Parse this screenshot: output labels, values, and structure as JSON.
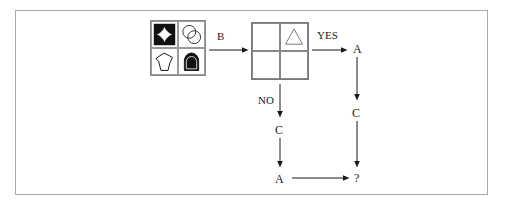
{
  "diagram": {
    "type": "flowchart-visual-reasoning-puzzle",
    "background_color": "#ffffff",
    "frame_border_color": "#a9a9a9",
    "ink_color": "#1a1a1a"
  },
  "source_grid": {
    "name": "source-shape-grid",
    "rows": 2,
    "columns": 2,
    "cells": [
      {
        "position": "top-left",
        "shape": "concave-diamond-astroid",
        "fill": "black-square-background",
        "shape_fill": "white",
        "outline": "black"
      },
      {
        "position": "top-right",
        "shape": "two-overlapping-circles",
        "fill": "white",
        "outline": "black"
      },
      {
        "position": "bottom-left",
        "shape": "irregular-pentagon",
        "fill": "white",
        "outline": "black"
      },
      {
        "position": "bottom-right",
        "shape": "solid-arch-dome",
        "fill": "black",
        "outline": "black"
      }
    ]
  },
  "target_grid": {
    "name": "target-shape-grid",
    "rows": 2,
    "columns": 2,
    "cells": [
      {
        "position": "top-left",
        "shape": "empty"
      },
      {
        "position": "top-right",
        "shape": "triangle",
        "fill": "white",
        "outline": "gray"
      },
      {
        "position": "bottom-left",
        "shape": "empty"
      },
      {
        "position": "bottom-right",
        "shape": "empty"
      }
    ]
  },
  "edges": {
    "transform_label": "B",
    "yes_label": "YES",
    "no_label": "NO"
  },
  "nodes": {
    "yes_branch_first": "A",
    "yes_branch_second": "C",
    "no_branch_first": "C",
    "no_branch_second": "A",
    "result": "?"
  }
}
